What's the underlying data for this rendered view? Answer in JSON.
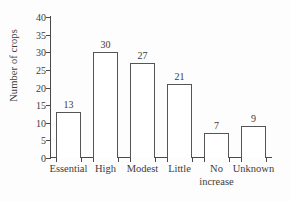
{
  "chart_data": {
    "type": "bar",
    "title": "",
    "subtitle": "",
    "xlabel": "",
    "ylabel": "Number of crops",
    "categories": [
      "Essential",
      "High",
      "Modest",
      "Little",
      "No increase",
      "Unknown"
    ],
    "category_lines": [
      [
        "Essential"
      ],
      [
        "High"
      ],
      [
        "Modest"
      ],
      [
        "Little"
      ],
      [
        "No",
        "increase"
      ],
      [
        "Unknown"
      ]
    ],
    "values": [
      13,
      30,
      27,
      21,
      7,
      9
    ],
    "data_labels": [
      "13",
      "30",
      "27",
      "21",
      "7",
      "9"
    ],
    "ylim": [
      0,
      40
    ],
    "ytick_values": [
      0,
      5,
      10,
      15,
      20,
      25,
      30,
      35,
      40
    ],
    "ytick_labels": [
      "0",
      "5",
      "10",
      "15",
      "20",
      "25",
      "30",
      "35",
      "40"
    ],
    "grid": false,
    "legend": null,
    "bar_fill": "#ffffff",
    "bar_edge": "#555555",
    "axis_color": "#4a4a4a",
    "text_color": "#3c3c3c",
    "background": "#fdfdfd"
  }
}
